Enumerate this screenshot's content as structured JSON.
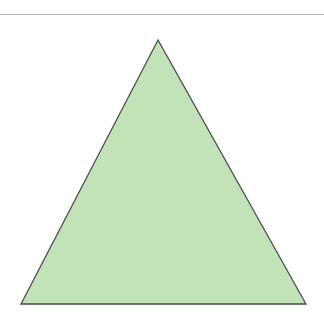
{
  "diagram": {
    "shape": "triangle",
    "fill_color": "#c1e3b7",
    "stroke_color": "#4a4a4a",
    "points": [
      [
        158,
        40
      ],
      [
        306,
        304
      ],
      [
        21,
        304
      ]
    ]
  },
  "divider": {
    "color": "#b8b8b8"
  }
}
